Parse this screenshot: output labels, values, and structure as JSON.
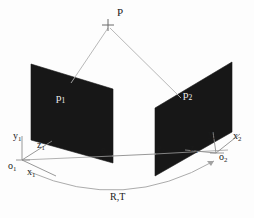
{
  "figure": {
    "background_color": "#fdfdfd",
    "line_color": "#9a9a9a",
    "plane_fill": "#171717",
    "text_color": "#1a1a1a",
    "text_on_dark": "#f2f2f2",
    "width": 254,
    "height": 218
  },
  "labels": {
    "scene_point": "P",
    "image_plane_left": "p",
    "image_plane_left_sub": "1",
    "image_plane_right": "p",
    "image_plane_right_sub": "2",
    "epipole_left": "e",
    "epipole_left_sub": "1",
    "epipole_right": "e",
    "epipole_right_sub": "2",
    "origin_left": "o",
    "origin_left_sub": "1",
    "origin_right": "o",
    "origin_right_sub": "2",
    "axis_x_left": "x",
    "axis_x_left_sub": "1",
    "axis_y_left": "y",
    "axis_y_left_sub": "1",
    "axis_z_left": "z",
    "axis_z_left_sub": "1",
    "axis_x_right": "x",
    "axis_x_right_sub": "2",
    "axis_y_right": "y",
    "axis_y_right_sub": "2",
    "axis_z_right": "z",
    "axis_z_right_sub": "2",
    "transform": "R,T"
  },
  "geometry": {
    "scene_point_marker": {
      "x": 108,
      "y": 25,
      "arm": 6
    },
    "plane_left_polygon": "31,64 113,89 113,163 31,140",
    "plane_right_polygon": "232,62 155,108 155,176 232,132",
    "ray_left": {
      "x1": 108,
      "y1": 27,
      "x2": 71,
      "y2": 83
    },
    "ray_right": {
      "x1": 110,
      "y1": 27,
      "x2": 180,
      "y2": 97
    },
    "baseline": {
      "x1": 22,
      "y1": 160,
      "x2": 228,
      "y2": 150
    },
    "epipolar_segment": {
      "x1": 113,
      "y1": 156,
      "x2": 155,
      "y2": 154
    },
    "transform_arc": "M 30,172 Q 124,212 216,161",
    "axes_left_origin": {
      "x": 22,
      "y": 160
    },
    "axes_right_origin": {
      "x": 216,
      "y": 153
    }
  },
  "label_positions": {
    "scene_point": {
      "x": 117,
      "y": 12
    },
    "image_plane_left": {
      "x": 56,
      "y": 98
    },
    "image_plane_right": {
      "x": 182,
      "y": 96
    },
    "epipole_left": {
      "x": 100,
      "y": 150
    },
    "epipole_right": {
      "x": 158,
      "y": 147
    },
    "origin_left": {
      "x": 9,
      "y": 164
    },
    "origin_right": {
      "x": 219,
      "y": 156
    },
    "axis_x_left": {
      "x": 26,
      "y": 170
    },
    "axis_y_left": {
      "x": 13,
      "y": 135
    },
    "axis_z_left": {
      "x": 37,
      "y": 144
    },
    "axis_x_right": {
      "x": 232,
      "y": 135
    },
    "axis_y_right": {
      "x": 209,
      "y": 134
    },
    "axis_z_right": {
      "x": 190,
      "y": 148
    },
    "transform": {
      "x": 110,
      "y": 196
    }
  }
}
